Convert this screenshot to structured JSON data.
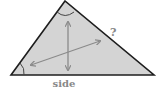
{
  "diagram": {
    "type": "triangle-geometry",
    "labels": {
      "unknown_side": "?",
      "base_side": "side"
    },
    "colors": {
      "fill": "#d4d4d4",
      "outline": "#1e1e1e",
      "arrows": "#8a8a8a",
      "angle_marks": "#444444",
      "label": "#888888"
    },
    "icons": {
      "vertical_arrow": "double-headed-arrow-vertical",
      "diagonal_arrow": "double-headed-arrow-diagonal",
      "apex_angle": "angle-arc",
      "left_angle": "angle-arc"
    }
  }
}
